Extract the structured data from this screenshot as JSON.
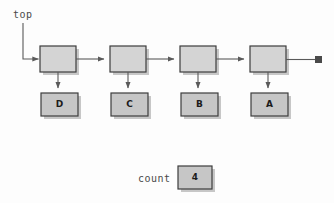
{
  "diagram": {
    "title_label": "top",
    "count_label": "count",
    "count_value": "4",
    "colors": {
      "background": "#fdfdfd",
      "node_fill": "#d4d4d4",
      "data_fill": "#c6c6c6",
      "stroke": "#3d3d3d",
      "shadow": "#9a9a9a",
      "arrow": "#5a5a5a",
      "text": "#1b1b1b",
      "label_text": "#4a4a4a",
      "terminator_fill": "#4a4a4a"
    },
    "nodes": [
      {
        "id": "node-1",
        "data_label": "D",
        "x": 40,
        "y": 46,
        "w": 36,
        "h": 26,
        "data_x": 41,
        "data_y": 93,
        "data_w": 37,
        "data_h": 23
      },
      {
        "id": "node-2",
        "data_label": "C",
        "x": 110,
        "y": 46,
        "w": 36,
        "h": 26,
        "data_x": 111,
        "data_y": 93,
        "data_w": 37,
        "data_h": 23
      },
      {
        "id": "node-3",
        "data_label": "B",
        "x": 180,
        "y": 46,
        "w": 36,
        "h": 26,
        "data_x": 181,
        "data_y": 93,
        "data_w": 37,
        "data_h": 23
      },
      {
        "id": "node-4",
        "data_label": "A",
        "x": 250,
        "y": 46,
        "w": 36,
        "h": 26,
        "data_x": 251,
        "data_y": 93,
        "data_w": 37,
        "data_h": 23
      }
    ],
    "count_box": {
      "x": 178,
      "y": 166,
      "w": 34,
      "h": 23
    },
    "terminator": {
      "x": 315,
      "y": 56,
      "w": 7,
      "h": 7
    },
    "icons": {
      "arrow_right": "arrow-right-icon",
      "arrow_down": "arrow-down-icon",
      "null_terminator": "null-terminator-icon"
    }
  }
}
